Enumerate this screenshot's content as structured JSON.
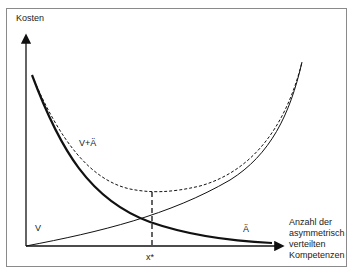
{
  "diagram": {
    "y_axis_label": "Kosten",
    "x_axis_label": "Anzahl der asymmetrisch verteilten Kompetenzen",
    "x_axis_label_lines": [
      "Anzahl der",
      "asymmetrisch",
      "verteilten",
      "Kompetenzen"
    ],
    "curves": [
      {
        "name": "V",
        "label": "V",
        "style": "solid-thin",
        "trend": "increasing"
      },
      {
        "name": "Ä",
        "label": "Ä",
        "style": "solid-thick",
        "trend": "decreasing"
      },
      {
        "name": "V+Ä",
        "label": "V+Ä",
        "style": "dashed",
        "trend": "u-shaped"
      }
    ],
    "optimum_marker": "x*",
    "colors": {
      "line": "#111111",
      "frame": "#8a8a8a",
      "background": "#ffffff"
    }
  }
}
